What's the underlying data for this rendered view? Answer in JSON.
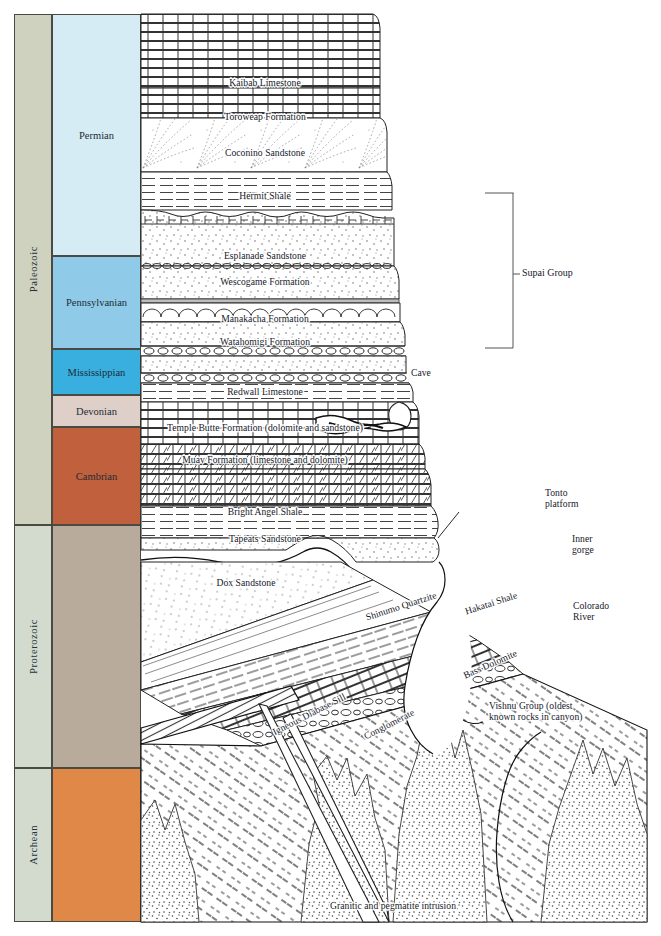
{
  "figure": {
    "kind": "geologic-cross-section"
  },
  "eras": [
    {
      "name": "Paleozoic",
      "color": "#cfd2bf",
      "top": 14,
      "bottom": 525
    },
    {
      "name": "Proterozoic",
      "color": "#d3dbce",
      "top": 525,
      "bottom": 768
    },
    {
      "name": "Archean",
      "color": "#d3dbce",
      "top": 768,
      "bottom": 922
    }
  ],
  "periods": [
    {
      "name": "Permian",
      "color": "#d6ecf5",
      "top": 14,
      "bottom": 256
    },
    {
      "name": "Pennsylvanian",
      "color": "#8fcbe8",
      "top": 256,
      "bottom": 349
    },
    {
      "name": "Mississippian",
      "color": "#39afe0",
      "top": 349,
      "bottom": 395
    },
    {
      "name": "Devonian",
      "color": "#ded0c8",
      "top": 395,
      "bottom": 427
    },
    {
      "name": "Cambrian",
      "color": "#c1603c",
      "top": 427,
      "bottom": 525
    },
    {
      "name": "",
      "color": "#b8ab9c",
      "top": 525,
      "bottom": 768
    },
    {
      "name": "",
      "color": "#e08847",
      "top": 768,
      "bottom": 922
    }
  ],
  "formations": [
    {
      "label": "Kaibab Limestone",
      "x": 124,
      "y": 63,
      "align": "center"
    },
    {
      "label": "Toroweap Formation",
      "x": 124,
      "y": 97,
      "align": "center"
    },
    {
      "label": "Coconino Sandstone",
      "x": 124,
      "y": 133,
      "align": "center"
    },
    {
      "label": "Hermit Shale",
      "x": 124,
      "y": 176,
      "align": "center"
    },
    {
      "label": "Esplanade Sandstone",
      "x": 124,
      "y": 236,
      "align": "center"
    },
    {
      "label": "Wescogame Formation",
      "x": 124,
      "y": 262,
      "align": "center"
    },
    {
      "label": "Manakacha Formation",
      "x": 124,
      "y": 299,
      "align": "center"
    },
    {
      "label": "Watahomigi Formation",
      "x": 124,
      "y": 322,
      "align": "center"
    },
    {
      "label": "Redwall Limestone",
      "x": 124,
      "y": 372,
      "align": "center"
    },
    {
      "label": "Temple Butte Formation (dolomite and sandstone)",
      "x": 124,
      "y": 408,
      "align": "center"
    },
    {
      "label": "Muav Formation (limestone and dolomite)",
      "x": 124,
      "y": 440,
      "align": "center"
    },
    {
      "label": "Bright Angel Shale",
      "x": 124,
      "y": 492,
      "align": "center"
    },
    {
      "label": "Tapeats Sandstone",
      "x": 124,
      "y": 519,
      "align": "center"
    },
    {
      "label": "Dox Sandstone",
      "x": 105,
      "y": 563,
      "align": "center"
    }
  ],
  "tilted_formations": [
    {
      "label": "Shinumo Quartzite",
      "x": 260,
      "y": 592,
      "rotate": -18
    },
    {
      "label": "Hakatai Shale",
      "x": 350,
      "y": 589,
      "rotate": -18
    },
    {
      "label": "Bass Dolomite",
      "x": 349,
      "y": 650,
      "rotate": -24
    },
    {
      "label": "Conglomerate",
      "x": 248,
      "y": 710,
      "rotate": -27
    },
    {
      "label": "Igneous Diabase Sill",
      "x": 168,
      "y": 700,
      "rotate": -27
    }
  ],
  "annotations": [
    {
      "label": "Cave",
      "x": 411,
      "y": 367,
      "align": "left"
    },
    {
      "label": "Tonto\nplatform",
      "x": 545,
      "y": 487,
      "align": "left"
    },
    {
      "label": "Inner\ngorge",
      "x": 572,
      "y": 533,
      "align": "left"
    },
    {
      "label": "Colorado\nRiver",
      "x": 573,
      "y": 600,
      "align": "left"
    },
    {
      "label": "Vishnu Group (oldest\nknown rocks in canyon)",
      "x": 489,
      "y": 700,
      "align": "left"
    },
    {
      "label": "Granitic and pegmatite intrusion",
      "x": 330,
      "y": 900,
      "align": "left"
    }
  ],
  "bracket": {
    "label": "Supai Group",
    "label_x": 522,
    "label_y": 274,
    "x": 513,
    "top": 193,
    "bottom": 348,
    "tick_y": 274
  },
  "colors": {
    "ink": "#1b1b1b",
    "paper": "#ffffff",
    "era_fill": "#d3dbce",
    "paleozoic_fill": "#cfd2bf"
  }
}
